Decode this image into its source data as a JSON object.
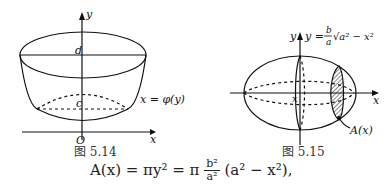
{
  "figure_left": {
    "caption": "图 5.14",
    "labels": {
      "y_axis": "y",
      "x_axis": "x",
      "origin": "O",
      "top": "d",
      "bottom": "c",
      "curve": "x = φ(y)"
    }
  },
  "figure_right": {
    "caption": "图 5.15",
    "labels": {
      "y_axis": "y",
      "x_axis": "x",
      "x_pos": "x",
      "curve_lhs": "y =",
      "curve_num": "b",
      "curve_den": "a",
      "curve_root": "√a² − x²",
      "area": "A(x)"
    }
  },
  "formula": {
    "lhs": "A(x) = πy² = π",
    "num": "b²",
    "den": "a²",
    "rhs": "(a² − x²),"
  }
}
